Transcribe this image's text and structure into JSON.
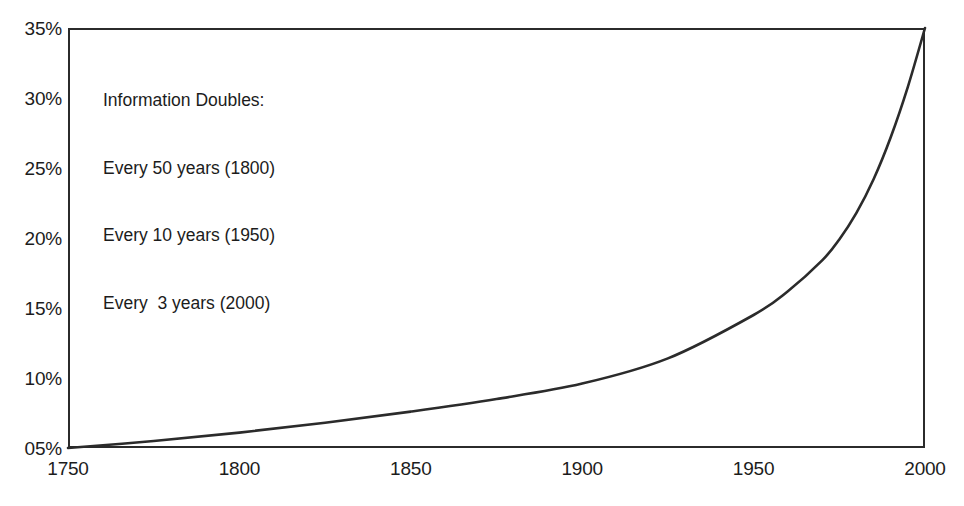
{
  "chart_data": {
    "type": "line",
    "title": "",
    "subtitle": "",
    "xlabel": "",
    "ylabel": "",
    "xlim": [
      1750,
      2000
    ],
    "ylim": [
      5,
      35
    ],
    "grid": false,
    "legend": null,
    "line_color": "#2b2b2b",
    "frame_color": "#2b2b2b",
    "background": "#ffffff",
    "xticks": [
      "1750",
      "1800",
      "1850",
      "1900",
      "1950",
      "2000"
    ],
    "xtick_values": [
      1750,
      1800,
      1850,
      1900,
      1950,
      2000
    ],
    "yticks": [
      "05%",
      "10%",
      "15%",
      "20%",
      "25%",
      "30%",
      "35%"
    ],
    "ytick_values": [
      5,
      10,
      15,
      20,
      25,
      30,
      35
    ],
    "x": [
      1750,
      1775,
      1800,
      1825,
      1850,
      1875,
      1900,
      1925,
      1950,
      1960,
      1970,
      1975,
      1980,
      1985,
      1990,
      1995,
      2000
    ],
    "values": [
      5.0,
      5.5,
      6.1,
      6.8,
      7.6,
      8.5,
      9.6,
      11.4,
      14.5,
      16.2,
      18.4,
      19.9,
      21.8,
      24.2,
      27.2,
      30.8,
      35.0
    ],
    "series": [
      {
        "name": "Information growth",
        "values": [
          5.0,
          5.5,
          6.1,
          6.8,
          7.6,
          8.5,
          9.6,
          11.4,
          14.5,
          16.2,
          18.4,
          19.9,
          21.8,
          24.2,
          27.2,
          30.8,
          35.0
        ]
      }
    ],
    "annotations": [
      {
        "name": "information-doubles-note",
        "lines": [
          "Information Doubles:",
          "Every 50 years (1800)",
          "Every 10 years (1950)",
          "Every  3 years (2000)"
        ]
      }
    ]
  },
  "annotation": {
    "line1": "Information Doubles:",
    "line2": "Every 50 years (1800)",
    "line3": "Every 10 years (1950)",
    "line4": "Every  3 years (2000)"
  }
}
